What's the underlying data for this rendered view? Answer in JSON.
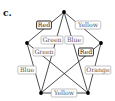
{
  "figure": {
    "panel_label": "c.",
    "nodes": [
      {
        "id": "top",
        "x": 64,
        "y": 12
      },
      {
        "id": "left",
        "x": 27,
        "y": 43
      },
      {
        "id": "right",
        "x": 101,
        "y": 43
      },
      {
        "id": "bottom-left",
        "x": 41,
        "y": 93
      },
      {
        "id": "bottom-right",
        "x": 88,
        "y": 93
      }
    ],
    "edges": [
      {
        "from": "top",
        "to": "left",
        "label": "Red",
        "lx": 44,
        "ly": 25,
        "bold": true
      },
      {
        "from": "top",
        "to": "right",
        "label": "Yellow",
        "lx": 88,
        "ly": 25,
        "bold": false
      },
      {
        "from": "top",
        "to": "bottom-left",
        "label": "Green",
        "lx": 52,
        "ly": 40,
        "bold": false
      },
      {
        "from": "top",
        "to": "bottom-right",
        "label": "Blue",
        "lx": 74,
        "ly": 40,
        "bold": false
      },
      {
        "from": "left",
        "to": "bottom-right",
        "label": "Green",
        "lx": 44,
        "ly": 52,
        "bold": false
      },
      {
        "from": "right",
        "to": "bottom-left",
        "label": "Red",
        "lx": 86,
        "ly": 52,
        "bold": true
      },
      {
        "from": "left",
        "to": "bottom-left",
        "label": "Blue",
        "lx": 27,
        "ly": 70,
        "bold": false
      },
      {
        "from": "right",
        "to": "bottom-right",
        "label": "Orange",
        "lx": 98,
        "ly": 70,
        "bold": false
      },
      {
        "from": "bottom-left",
        "to": "bottom-right",
        "label": "Yellow",
        "lx": 64,
        "ly": 93,
        "bold": false
      }
    ],
    "colors": {
      "line": "#222222",
      "node": "#000000",
      "label_border": "#999999",
      "label_border_bold": "#111111",
      "label_text": "#555555"
    }
  }
}
